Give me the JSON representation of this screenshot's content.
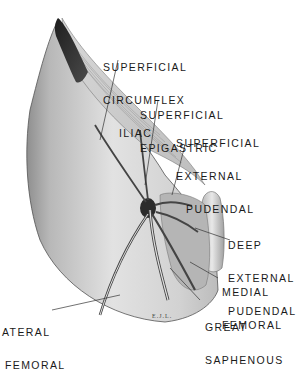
{
  "figure": {
    "type": "anatomical illustration",
    "colors": {
      "background": "#ffffff",
      "skin_light": "#e6e6e6",
      "skin_shadow": "#9a9a9a",
      "muscle_dark": "#2a2a2a",
      "leader_line": "#333333",
      "text": "#1a1a1a"
    }
  },
  "labels": {
    "superficial_circumflex_iliac": {
      "line1": "SUPERFICIAL",
      "line2": "CIRCUMFLEX",
      "line3": "ILIAC"
    },
    "superficial_epigastric": {
      "line1": "SUPERFICIAL",
      "line2": "EPIGASTRIC"
    },
    "superficial_external_pudendal": {
      "line1": "SUPERFICIAL",
      "line2": "EXTERNAL",
      "line3": "PUDENDAL"
    },
    "deep_external_pudendal": {
      "line1": "DEEP",
      "line2": "EXTERNAL",
      "line3": "PUDENDAL"
    },
    "medial_femoral": {
      "line1": "MEDIAL",
      "line2": "FEMORAL"
    },
    "great_saphenous": {
      "line1": "GREAT",
      "line2": "SAPHENOUS"
    },
    "lateral_femoral": {
      "line1": "ATERAL",
      "line2": "FEMORAL"
    }
  },
  "signature": "E.J.L."
}
